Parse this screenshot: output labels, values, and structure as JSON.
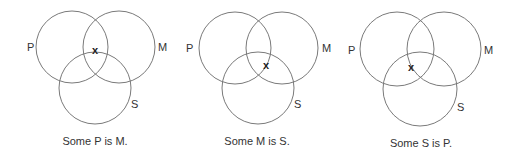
{
  "colors": {
    "circle_stroke": "#7a7a7a",
    "text": "#333333",
    "mark": "#222222",
    "background": "#ffffff"
  },
  "diagrams": [
    {
      "caption": "Some P is M.",
      "caption_pos": {
        "x": 95,
        "y": 145
      },
      "circles": [
        {
          "label": "P",
          "cx": 72,
          "cy": 47,
          "r": 36,
          "label_x": 27,
          "label_y": 51
        },
        {
          "label": "M",
          "cx": 119,
          "cy": 47,
          "r": 36,
          "label_x": 158,
          "label_y": 51
        },
        {
          "label": "S",
          "cx": 95,
          "cy": 88,
          "r": 36,
          "label_x": 131,
          "label_y": 108
        }
      ],
      "mark": {
        "text": "x",
        "x": 95,
        "y": 54
      }
    },
    {
      "caption": "Some M is S.",
      "caption_pos": {
        "x": 257,
        "y": 145
      },
      "circles": [
        {
          "label": "P",
          "cx": 235,
          "cy": 48,
          "r": 36,
          "label_x": 186,
          "label_y": 52
        },
        {
          "label": "M",
          "cx": 282,
          "cy": 48,
          "r": 36,
          "label_x": 322,
          "label_y": 52
        },
        {
          "label": "S",
          "cx": 258,
          "cy": 88,
          "r": 36,
          "label_x": 294,
          "label_y": 108
        }
      ],
      "mark": {
        "text": "x",
        "x": 266,
        "y": 69
      }
    },
    {
      "caption": "Some S is P.",
      "caption_pos": {
        "x": 421,
        "y": 147
      },
      "circles": [
        {
          "label": "P",
          "cx": 397,
          "cy": 49,
          "r": 37,
          "label_x": 348,
          "label_y": 54
        },
        {
          "label": "M",
          "cx": 444,
          "cy": 49,
          "r": 37,
          "label_x": 484,
          "label_y": 54
        },
        {
          "label": "S",
          "cx": 420,
          "cy": 89,
          "r": 37,
          "label_x": 457,
          "label_y": 111
        }
      ],
      "mark": {
        "text": "x",
        "x": 411,
        "y": 71
      }
    }
  ]
}
